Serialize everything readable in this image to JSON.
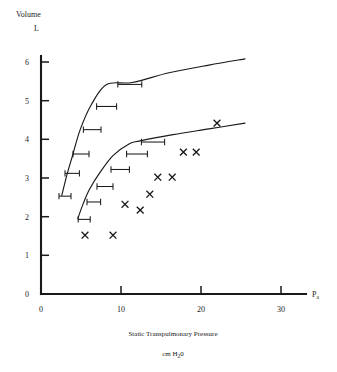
{
  "chart_data": {
    "type": "scatter",
    "title": "",
    "xlabel": "Static Transpulmonary Pressure",
    "xlabel_units": "cm H†2O",
    "ylabel": "Volume",
    "ylabel_units": "L",
    "x_axis_end_label": "P",
    "x_axis_end_sub": "a",
    "xlim": [
      0,
      31
    ],
    "ylim": [
      0,
      6.4
    ],
    "xticks": [
      0,
      10,
      20,
      30
    ],
    "yticks": [
      0,
      1,
      2,
      3,
      4,
      5,
      6
    ],
    "xtick_labels": [
      "0",
      "10",
      "20",
      "30"
    ],
    "ytick_labels": [
      "0",
      "1",
      "2",
      "3",
      "4",
      "5",
      "6"
    ],
    "grid": false,
    "legend": "none",
    "series": [
      {
        "name": "upper-curve",
        "type": "line",
        "points": [
          [
            2.6,
            2.55
          ],
          [
            3.2,
            3.05
          ],
          [
            3.9,
            3.55
          ],
          [
            4.9,
            4.25
          ],
          [
            6.3,
            4.9
          ],
          [
            8.2,
            5.42
          ],
          [
            11.4,
            5.47
          ],
          [
            16.0,
            5.72
          ],
          [
            21.0,
            5.92
          ],
          [
            25.5,
            6.08
          ]
        ]
      },
      {
        "name": "lower-curve",
        "type": "line",
        "points": [
          [
            4.6,
            1.95
          ],
          [
            5.3,
            2.35
          ],
          [
            6.1,
            2.72
          ],
          [
            7.4,
            3.15
          ],
          [
            9.0,
            3.58
          ],
          [
            11.0,
            3.88
          ],
          [
            12.4,
            3.96
          ],
          [
            16.5,
            4.12
          ],
          [
            21.0,
            4.27
          ],
          [
            25.5,
            4.42
          ]
        ]
      },
      {
        "name": "error-bars-upper",
        "type": "errorbar-horizontal",
        "points": [
          {
            "x": 3.0,
            "y": 2.53,
            "xerr_low": 0.75,
            "xerr_high": 0.75
          },
          {
            "x": 3.9,
            "y": 3.12,
            "xerr_low": 0.9,
            "xerr_high": 0.9
          },
          {
            "x": 5.0,
            "y": 3.62,
            "xerr_low": 1.0,
            "xerr_high": 1.0
          },
          {
            "x": 6.4,
            "y": 4.25,
            "xerr_low": 1.1,
            "xerr_high": 1.1
          },
          {
            "x": 8.2,
            "y": 4.85,
            "xerr_low": 1.25,
            "xerr_high": 1.25
          },
          {
            "x": 11.1,
            "y": 5.42,
            "xerr_low": 1.5,
            "xerr_high": 1.5
          }
        ]
      },
      {
        "name": "error-bars-lower",
        "type": "errorbar-horizontal",
        "points": [
          {
            "x": 5.4,
            "y": 1.93,
            "xerr_low": 0.75,
            "xerr_high": 0.75
          },
          {
            "x": 6.6,
            "y": 2.38,
            "xerr_low": 0.85,
            "xerr_high": 0.85
          },
          {
            "x": 8.0,
            "y": 2.78,
            "xerr_low": 1.0,
            "xerr_high": 1.0
          },
          {
            "x": 9.9,
            "y": 3.22,
            "xerr_low": 1.15,
            "xerr_high": 1.15
          },
          {
            "x": 12.0,
            "y": 3.62,
            "xerr_low": 1.3,
            "xerr_high": 1.3
          },
          {
            "x": 14.0,
            "y": 3.93,
            "xerr_low": 1.45,
            "xerr_high": 1.45
          }
        ]
      },
      {
        "name": "measured-points",
        "type": "scatter",
        "marker": "x",
        "points": [
          [
            5.5,
            1.52
          ],
          [
            9.0,
            1.52
          ],
          [
            10.5,
            2.32
          ],
          [
            12.4,
            2.17
          ],
          [
            13.6,
            2.58
          ],
          [
            14.6,
            3.02
          ],
          [
            16.4,
            3.02
          ],
          [
            17.8,
            3.67
          ],
          [
            19.4,
            3.67
          ],
          [
            22.0,
            4.42
          ]
        ]
      }
    ]
  },
  "caption": {
    "x_primary": "Static Transpulmonary Pressure",
    "x_secondary": "cm H",
    "x_secondary_sub": "2",
    "x_secondary_tail": "0"
  }
}
